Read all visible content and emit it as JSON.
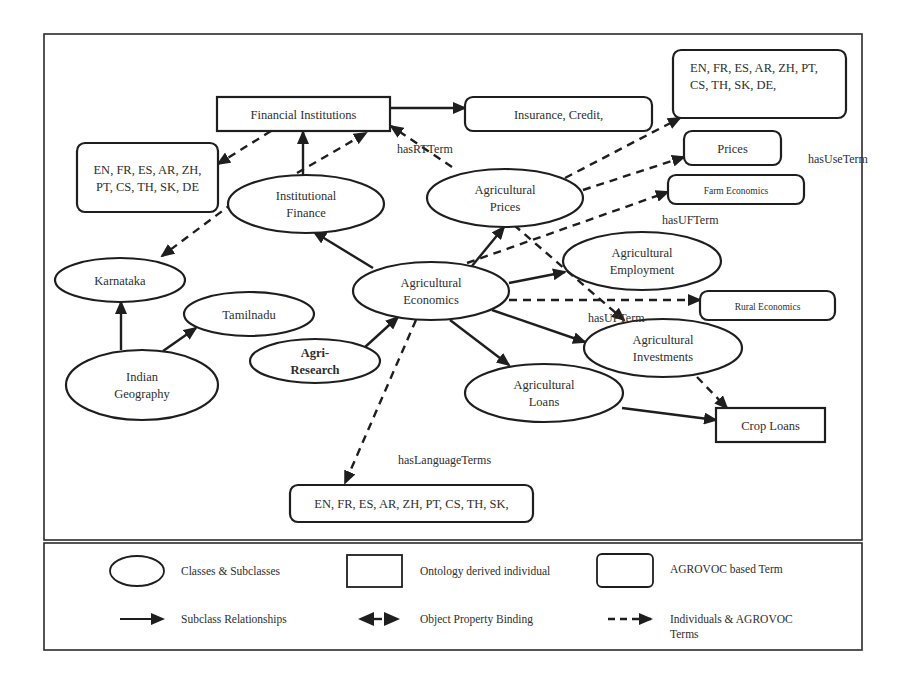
{
  "diagram": {
    "title": "",
    "nodes": [
      {
        "id": "financial-institutions",
        "type": "individual",
        "shape": "rect",
        "x": 217,
        "y": 97,
        "w": 173,
        "h": 34,
        "lines": [
          "Financial Institutions"
        ]
      },
      {
        "id": "insurance-credit",
        "type": "agrovoc-term",
        "shape": "rounded",
        "x": 465,
        "y": 97,
        "w": 187,
        "h": 34,
        "lines": [
          "Insurance, Credit,"
        ]
      },
      {
        "id": "agrovoc-langs-top",
        "type": "agrovoc-term",
        "shape": "rounded",
        "x": 673,
        "y": 50,
        "w": 173,
        "h": 68,
        "lines": [
          "EN,  FR,  ES,  AR,  ZH,  PT,",
          "CS, TH, SK, DE,"
        ],
        "align": "start",
        "tx": 690,
        "ty": 72
      },
      {
        "id": "prices",
        "type": "agrovoc-term",
        "shape": "rounded",
        "x": 684,
        "y": 131,
        "w": 97,
        "h": 34,
        "lines": [
          "Prices"
        ]
      },
      {
        "id": "farm-economics",
        "type": "agrovoc-term",
        "shape": "rounded",
        "x": 668,
        "y": 175,
        "w": 136,
        "h": 29,
        "lines": [
          "Farm Economics"
        ],
        "small": true,
        "ty": 194
      },
      {
        "id": "rural-economics",
        "type": "agrovoc-term",
        "shape": "rounded",
        "x": 700,
        "y": 291,
        "w": 135,
        "h": 29,
        "lines": [
          "Rural Economics"
        ],
        "small": true,
        "ty": 310
      },
      {
        "id": "agrovoc-langs-left",
        "type": "agrovoc-term",
        "shape": "rounded",
        "x": 77,
        "y": 143,
        "w": 141,
        "h": 69,
        "lines": [
          "EN, FR, ES, AR, ZH,",
          "PT, CS, TH, SK, DE"
        ]
      },
      {
        "id": "crop-loans",
        "type": "individual",
        "shape": "rect",
        "x": 716,
        "y": 408,
        "w": 109,
        "h": 34,
        "lines": [
          "Crop Loans"
        ]
      },
      {
        "id": "agrovoc-langs-bottom",
        "type": "agrovoc-term",
        "shape": "rounded",
        "x": 290,
        "y": 485,
        "w": 243,
        "h": 37,
        "lines": [
          "EN, FR, ES, AR, ZH, PT, CS, TH, SK,"
        ]
      },
      {
        "id": "institutional-finance",
        "type": "class",
        "shape": "ellipse",
        "cx": 306,
        "cy": 204,
        "rx": 78,
        "ry": 29,
        "lines": [
          "Institutional",
          "Finance"
        ]
      },
      {
        "id": "agricultural-prices",
        "type": "class",
        "shape": "ellipse",
        "cx": 505,
        "cy": 198,
        "rx": 78,
        "ry": 29,
        "lines": [
          "Agricultural",
          "Prices"
        ]
      },
      {
        "id": "karnataka",
        "type": "class",
        "shape": "ellipse",
        "cx": 120,
        "cy": 280,
        "rx": 65,
        "ry": 22,
        "lines": [
          "Karnataka"
        ]
      },
      {
        "id": "tamilnadu",
        "type": "class",
        "shape": "ellipse",
        "cx": 249,
        "cy": 314,
        "rx": 65,
        "ry": 22,
        "lines": [
          "Tamilnadu"
        ]
      },
      {
        "id": "indian-geography",
        "type": "class",
        "shape": "ellipse",
        "cx": 142,
        "cy": 385,
        "rx": 76,
        "ry": 35,
        "lines": [
          "Indian",
          "Geography"
        ]
      },
      {
        "id": "agri-research",
        "type": "class",
        "shape": "ellipse",
        "cx": 315,
        "cy": 361,
        "rx": 65,
        "ry": 22,
        "lines": [
          "Agri-",
          "Research"
        ],
        "bold": true
      },
      {
        "id": "agricultural-economics",
        "type": "class",
        "shape": "ellipse",
        "cx": 431,
        "cy": 291,
        "rx": 78,
        "ry": 29,
        "lines": [
          "Agricultural",
          "Economics"
        ]
      },
      {
        "id": "agricultural-employment",
        "type": "class",
        "shape": "ellipse",
        "cx": 642,
        "cy": 261,
        "rx": 79,
        "ry": 29,
        "lines": [
          "Agricultural",
          "Employment"
        ]
      },
      {
        "id": "agricultural-investments",
        "type": "class",
        "shape": "ellipse",
        "cx": 663,
        "cy": 348,
        "rx": 79,
        "ry": 29,
        "lines": [
          "Agricultural",
          "Investments"
        ]
      },
      {
        "id": "agricultural-loans",
        "type": "class",
        "shape": "ellipse",
        "cx": 544,
        "cy": 393,
        "rx": 79,
        "ry": 29,
        "lines": [
          "Agricultural",
          "Loans"
        ]
      }
    ],
    "edges": [
      {
        "kind": "subclass",
        "from": [
          390,
          108
        ],
        "to": [
          465,
          108
        ]
      },
      {
        "kind": "subclass",
        "from": [
          303,
          175
        ],
        "to": [
          303,
          132
        ]
      },
      {
        "kind": "subclass",
        "from": [
          373,
          268
        ],
        "to": [
          314,
          232
        ]
      },
      {
        "kind": "subclass",
        "from": [
          472,
          266
        ],
        "to": [
          504,
          227
        ]
      },
      {
        "kind": "subclass",
        "from": [
          509,
          283
        ],
        "to": [
          565,
          272
        ]
      },
      {
        "kind": "subclass",
        "from": [
          492,
          310
        ],
        "to": [
          585,
          342
        ]
      },
      {
        "kind": "subclass",
        "from": [
          450,
          320
        ],
        "to": [
          509,
          365
        ]
      },
      {
        "kind": "subclass",
        "from": [
          364,
          348
        ],
        "to": [
          398,
          317
        ]
      },
      {
        "kind": "subclass",
        "from": [
          121,
          350
        ],
        "to": [
          121,
          302
        ]
      },
      {
        "kind": "subclass",
        "from": [
          163,
          351
        ],
        "to": [
          196,
          328
        ]
      },
      {
        "kind": "subclass",
        "from": [
          622,
          408
        ],
        "to": [
          716,
          420
        ]
      },
      {
        "kind": "binding",
        "from": [
          271,
          131
        ],
        "to": [
          218,
          164
        ]
      },
      {
        "kind": "binding",
        "from": [
          297,
          173
        ],
        "to": [
          366,
          133
        ]
      },
      {
        "kind": "binding",
        "from": [
          452,
          167
        ],
        "to": [
          391,
          126
        ]
      },
      {
        "kind": "binding",
        "from": [
          565,
          178
        ],
        "to": [
          680,
          118
        ]
      },
      {
        "kind": "binding",
        "from": [
          583,
          190
        ],
        "to": [
          684,
          157
        ]
      },
      {
        "kind": "binding",
        "from": [
          467,
          263
        ],
        "to": [
          668,
          192
        ]
      },
      {
        "kind": "binding",
        "from": [
          509,
          300
        ],
        "to": [
          700,
          300
        ]
      },
      {
        "kind": "binding",
        "from": [
          514,
          225
        ],
        "to": [
          624,
          320
        ]
      },
      {
        "kind": "binding",
        "from": [
          233,
          203
        ],
        "to": [
          162,
          256
        ]
      },
      {
        "kind": "binding",
        "from": [
          697,
          377
        ],
        "to": [
          727,
          408
        ]
      },
      {
        "kind": "binding",
        "from": [
          416,
          320
        ],
        "to": [
          345,
          483
        ]
      }
    ],
    "edge_labels": [
      {
        "text": "hasRTTerm",
        "x": 397,
        "y": 153
      },
      {
        "text": "hasUseTerm",
        "x": 808,
        "y": 163
      },
      {
        "text": "hasUFTerm",
        "x": 662,
        "y": 224
      },
      {
        "text": "hasUPTerm",
        "x": 588,
        "y": 322
      },
      {
        "text": "hasLanguageTerms",
        "x": 398,
        "y": 464
      }
    ]
  },
  "legend": {
    "items": [
      {
        "id": "legend-class",
        "symbol": "ellipse",
        "label": "Classes & Subclasses"
      },
      {
        "id": "legend-individual",
        "symbol": "rect",
        "label": "Ontology derived individual"
      },
      {
        "id": "legend-agrovoc",
        "symbol": "rounded",
        "label": "AGROVOC based Term"
      },
      {
        "id": "legend-subclass",
        "symbol": "solid-arrow",
        "label": "Subclass Relationships"
      },
      {
        "id": "legend-binding",
        "symbol": "double-arrow",
        "label": "Object Property Binding"
      },
      {
        "id": "legend-agrovoc-link",
        "symbol": "dashed-arrow",
        "label_lines": [
          "Individuals & AGROVOC",
          "Terms"
        ]
      }
    ]
  },
  "colors": {
    "stroke": "#1e1e1e",
    "text": "#2e2e2e",
    "background": "#ffffff"
  }
}
